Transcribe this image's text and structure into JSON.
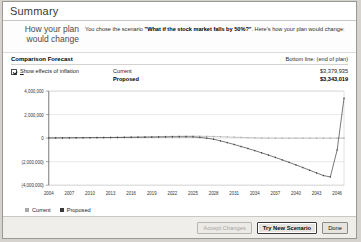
{
  "window": {
    "title": "Summary"
  },
  "intro": {
    "heading_line1": "How your plan",
    "heading_line2": "would change",
    "body_prefix": "You chose the scenario ",
    "scenario": "\"What if the stock market falls by 50%?\"",
    "body_suffix": ". Here's how your plan would change:"
  },
  "comparison": {
    "section_label": "Comparison Forecast",
    "bottom_line_label": "Bottom line: (end of plan)",
    "inflation_checkbox_label": "Show effects of inflation",
    "inflation_checkbox_accel": "S",
    "inflation_checkbox_rest": "how effects of inflation",
    "inflation_checked": true,
    "rows": [
      {
        "name": "Current",
        "value": "$3,379,935"
      },
      {
        "name": "Proposed",
        "value": "$3,343,019"
      }
    ]
  },
  "legend": {
    "items": [
      {
        "label": "Current",
        "color": "#a9a9a9"
      },
      {
        "label": "Proposed",
        "color": "#3a3a3a"
      }
    ]
  },
  "footer": {
    "buttons": [
      {
        "label": "Accept Changes",
        "state": "disabled"
      },
      {
        "label": "Try New Scenario",
        "state": "focused"
      },
      {
        "label": "Done",
        "state": "normal"
      }
    ]
  },
  "chart_data": {
    "type": "line",
    "title": "",
    "xlabel": "",
    "ylabel": "",
    "grid": true,
    "legend_position": "bottom-left",
    "ylim": [
      -4000000,
      4000000
    ],
    "yticks": [
      4000000,
      2000000,
      0,
      -2000000,
      -4000000
    ],
    "ytick_labels": [
      "4,000,000",
      "2,000,000",
      "0",
      "(2,000,000)",
      "(4,000,000)"
    ],
    "xlim": [
      2004,
      2047
    ],
    "xticks": [
      2004,
      2007,
      2010,
      2013,
      2016,
      2019,
      2022,
      2025,
      2028,
      2031,
      2034,
      2037,
      2040,
      2043,
      2046
    ],
    "xtick_labels": [
      "2004",
      "2007",
      "2010",
      "2013",
      "2016",
      "2019",
      "2022",
      "2025",
      "2028",
      "2031",
      "2034",
      "2037",
      "2040",
      "2043",
      "2046"
    ],
    "x": [
      2004,
      2005,
      2006,
      2007,
      2008,
      2009,
      2010,
      2011,
      2012,
      2013,
      2014,
      2015,
      2016,
      2017,
      2018,
      2019,
      2020,
      2021,
      2022,
      2023,
      2024,
      2025,
      2026,
      2027,
      2028,
      2029,
      2030,
      2031,
      2032,
      2033,
      2034,
      2035,
      2036,
      2037,
      2038,
      2039,
      2040,
      2041,
      2042,
      2043,
      2044,
      2045,
      2046,
      2047
    ],
    "series": [
      {
        "name": "Current",
        "color": "#a9a9a9",
        "values": [
          20000,
          25000,
          30000,
          35000,
          40000,
          45000,
          50000,
          55000,
          60000,
          65000,
          70000,
          80000,
          90000,
          100000,
          110000,
          120000,
          130000,
          140000,
          150000,
          160000,
          165000,
          170000,
          160000,
          150000,
          140000,
          120000,
          100000,
          80000,
          60000,
          40000,
          20000,
          10000,
          5000,
          0,
          0,
          0,
          0,
          0,
          0,
          0,
          0,
          0,
          0,
          0
        ]
      },
      {
        "name": "Proposed",
        "color": "#3a3a3a",
        "values": [
          15000,
          18000,
          22000,
          26000,
          30000,
          34000,
          38000,
          42000,
          46000,
          50000,
          55000,
          60000,
          66000,
          72000,
          78000,
          84000,
          90000,
          95000,
          100000,
          104000,
          106000,
          100000,
          60000,
          0,
          -90000,
          -230000,
          -380000,
          -540000,
          -710000,
          -880000,
          -1060000,
          -1250000,
          -1440000,
          -1640000,
          -1850000,
          -2060000,
          -2280000,
          -2500000,
          -2730000,
          -2960000,
          -3180000,
          -3300000,
          -1000000,
          3400000
        ]
      }
    ]
  }
}
